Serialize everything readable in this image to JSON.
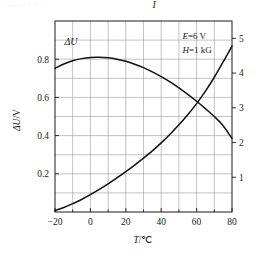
{
  "figure": {
    "top_fragment": "··—··· · ··· ·",
    "background_color": "#ffffff",
    "frame_color": "#1a1a1a",
    "grid_color": "#9a9a9a",
    "curve_color": "#111111"
  },
  "chart_data": {
    "type": "line",
    "title": "",
    "subtitle": "",
    "xlabel": "T/℃",
    "ylabel": "ΔU/V",
    "y2label": "",
    "xlim": [
      -20,
      80
    ],
    "ylim": [
      0,
      1.0
    ],
    "y2lim": [
      0,
      5.5
    ],
    "grid": true,
    "grid_x_step": 10,
    "grid_y_step": 0.1,
    "legend_position": "inline-curve-labels",
    "xticks": [
      -20,
      0,
      20,
      40,
      60,
      80
    ],
    "xticklabels": [
      "−20",
      "0",
      "20",
      "40",
      "60",
      "80"
    ],
    "xminorticks": [
      -10,
      10,
      30,
      50,
      70
    ],
    "yticks": [
      0.2,
      0.4,
      0.6,
      0.8
    ],
    "yticklabels": [
      "0.2",
      "0.4",
      "0.6",
      "0.8"
    ],
    "y2ticks": [
      1,
      2,
      3,
      4,
      5
    ],
    "y2ticklabels": [
      "1",
      "2",
      "3",
      "4",
      "5"
    ],
    "annotations": [
      {
        "name": "field-strength-E",
        "symbol": "E",
        "text": "=6 V",
        "x": 52,
        "y": 0.905
      },
      {
        "name": "magnetic-field-H",
        "symbol": "H",
        "text": "=1 kG",
        "x": 52,
        "y": 0.835
      }
    ],
    "series": [
      {
        "name": "ΔU",
        "label": "ΔU",
        "axis": "left",
        "units": "V",
        "label_point": {
          "x": -11,
          "y": 0.875
        },
        "x": [
          -20,
          -15,
          -10,
          -5,
          0,
          5,
          10,
          15,
          20,
          25,
          30,
          35,
          40,
          45,
          50,
          55,
          60,
          65,
          70,
          75,
          80
        ],
        "values": [
          0.752,
          0.775,
          0.792,
          0.803,
          0.809,
          0.81,
          0.807,
          0.8,
          0.789,
          0.774,
          0.756,
          0.734,
          0.709,
          0.681,
          0.65,
          0.616,
          0.58,
          0.541,
          0.5,
          0.452,
          0.385
        ]
      },
      {
        "name": "I",
        "label": "I",
        "axis": "right",
        "units": "",
        "label_point": {
          "x": 36,
          "y": 1.07
        },
        "x": [
          -20,
          -15,
          -10,
          -5,
          0,
          5,
          10,
          15,
          20,
          25,
          30,
          35,
          40,
          45,
          50,
          55,
          60,
          65,
          70,
          75,
          80
        ],
        "values": [
          0.04,
          0.13,
          0.24,
          0.36,
          0.5,
          0.65,
          0.81,
          0.98,
          1.16,
          1.35,
          1.55,
          1.76,
          1.99,
          2.24,
          2.51,
          2.8,
          3.12,
          3.48,
          3.88,
          4.32,
          4.78
        ]
      }
    ],
    "intersection": {
      "x": 64,
      "y_left": 0.52,
      "y_right": 3.35
    }
  }
}
